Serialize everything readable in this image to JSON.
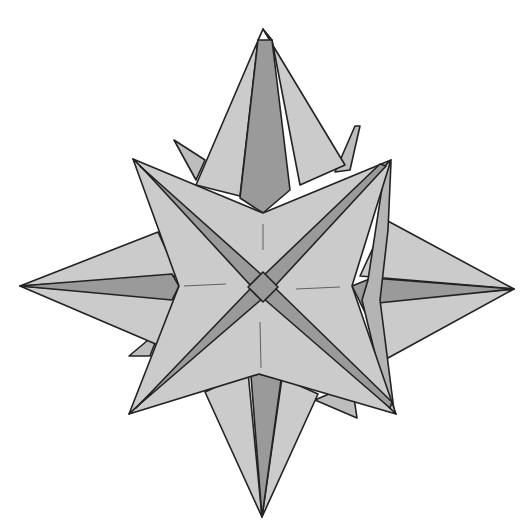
{
  "figure": {
    "colors": {
      "background": "#ffffff",
      "light_face": "#cbcbcb",
      "mid_face": "#b4b4b4",
      "dark_face": "#9a9a9a",
      "back_face": "#bdbdbd",
      "stroke": "#222222",
      "crease": "#444444"
    },
    "polygons": [
      {
        "name": "back-spike-top-left",
        "fill": "back_face",
        "points": "174,140 205,160 196,180"
      },
      {
        "name": "back-spike-top-right",
        "fill": "back_face",
        "points": "355,126 360,126 350,170 335,172"
      },
      {
        "name": "back-spike-bottom-left",
        "fill": "back_face",
        "points": "129,356 160,330 150,356"
      },
      {
        "name": "back-spike-bottom-right",
        "fill": "back_face",
        "points": "315,400 357,418 352,384"
      },
      {
        "name": "top-spike-left-face",
        "fill": "light_face",
        "points": "263,29 196,185 240,196 258,40"
      },
      {
        "name": "top-spike-right-face",
        "fill": "light_face",
        "points": "263,29 345,165 300,185 272,40"
      },
      {
        "name": "top-spike-center-face",
        "fill": "dark_face",
        "points": "258,40 272,40 290,190 263,213 240,198"
      },
      {
        "name": "bottom-spike-left-face",
        "fill": "light_face",
        "points": "262,517 205,392 248,372"
      },
      {
        "name": "bottom-spike-right-face",
        "fill": "light_face",
        "points": "262,517 318,394 282,378"
      },
      {
        "name": "bottom-spike-center-face",
        "fill": "dark_face",
        "points": "262,517 251,376 259,374 281,380"
      },
      {
        "name": "left-spike-top-face",
        "fill": "light_face",
        "points": "20,286 158,232 178,276"
      },
      {
        "name": "left-spike-bottom-face",
        "fill": "light_face",
        "points": "20,286 158,345 175,298"
      },
      {
        "name": "left-spike-center-face",
        "fill": "dark_face",
        "points": "20,286 172,274 179,286 172,300"
      },
      {
        "name": "right-spike-top-face",
        "fill": "light_face",
        "points": "514,289 386,220 360,276"
      },
      {
        "name": "right-spike-bottom-face",
        "fill": "light_face",
        "points": "514,289 388,358 360,302"
      },
      {
        "name": "right-spike-center-face",
        "fill": "dark_face",
        "points": "514,289 372,278 352,286 365,312 378,303"
      },
      {
        "name": "right-edge-strip",
        "fill": "mid_face",
        "points": "391,162 385,168 368,280 362,300 385,395 394,410 380,300 388,230"
      },
      {
        "name": "front-top-face",
        "fill": "light_face",
        "points": "133,159 263,213 391,160 263,287"
      },
      {
        "name": "front-right-face",
        "fill": "light_face",
        "points": "391,160 352,286 396,414 263,287"
      },
      {
        "name": "front-bottom-face",
        "fill": "light_face",
        "points": "396,414 259,374 129,414 263,287"
      },
      {
        "name": "front-left-face",
        "fill": "light_face",
        "points": "129,414 179,286 133,159 263,287"
      },
      {
        "name": "diagonal-groove-tl",
        "fill": "dark_face",
        "points": "140,166 263,276 252,287 146,172"
      },
      {
        "name": "diagonal-groove-tr",
        "fill": "dark_face",
        "points": "386,166 274,287 263,276 380,164"
      },
      {
        "name": "diagonal-groove-br",
        "fill": "dark_face",
        "points": "390,408 263,298 274,287 392,402"
      },
      {
        "name": "diagonal-groove-bl",
        "fill": "dark_face",
        "points": "136,408 252,287 263,298 140,404"
      },
      {
        "name": "center-diamond",
        "fill": "dark_face",
        "points": "263,272 278,287 263,302 248,287"
      }
    ],
    "creases": [
      {
        "name": "crease-top",
        "x1": 263,
        "y1": 224,
        "x2": 263,
        "y2": 250
      },
      {
        "name": "crease-bottom",
        "x1": 260,
        "y1": 322,
        "x2": 261,
        "y2": 368
      },
      {
        "name": "crease-left",
        "x1": 184,
        "y1": 286,
        "x2": 226,
        "y2": 284
      },
      {
        "name": "crease-right",
        "x1": 296,
        "y1": 289,
        "x2": 340,
        "y2": 287
      }
    ]
  }
}
